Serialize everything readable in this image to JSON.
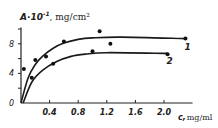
{
  "chart_data": {
    "type": "line",
    "title": "",
    "ylabel": "A·10⁻¹, mg/cm²",
    "ylabel_main": "A·10",
    "ylabel_exp": "-1",
    "ylabel_unit": ", mg/cm²",
    "xlabel": "c, mg/ml",
    "xlabel_main": "c,",
    "xlabel_unit": "mg/ml",
    "xlim": [
      0,
      2.4
    ],
    "ylim": [
      0,
      10
    ],
    "x_ticks": [
      "0.4",
      "0.8",
      "1.2",
      "1.6",
      "2.0"
    ],
    "x_tick_values": [
      0.4,
      0.8,
      1.2,
      1.6,
      2.0
    ],
    "y_ticks": [
      "0",
      "4",
      "8"
    ],
    "y_tick_values": [
      0,
      4,
      8
    ],
    "grid": false,
    "legend": "curve labels at right end",
    "series": [
      {
        "name": "1",
        "curve": [
          [
            0,
            0
          ],
          [
            0.1,
            3.4
          ],
          [
            0.2,
            5.2
          ],
          [
            0.3,
            6.3
          ],
          [
            0.45,
            7.4
          ],
          [
            0.6,
            8.1
          ],
          [
            0.8,
            8.6
          ],
          [
            1.0,
            8.8
          ],
          [
            1.4,
            8.9
          ],
          [
            2.3,
            8.7
          ]
        ],
        "points": [
          [
            0.04,
            4.6
          ],
          [
            0.2,
            5.8
          ],
          [
            0.35,
            6.3
          ],
          [
            0.6,
            8.3
          ],
          [
            1.1,
            9.7
          ],
          [
            2.3,
            8.7
          ]
        ]
      },
      {
        "name": "2",
        "curve": [
          [
            0.03,
            0
          ],
          [
            0.15,
            2.8
          ],
          [
            0.3,
            4.4
          ],
          [
            0.5,
            5.6
          ],
          [
            0.7,
            6.3
          ],
          [
            0.9,
            6.6
          ],
          [
            1.2,
            6.8
          ],
          [
            2.05,
            6.7
          ]
        ],
        "points": [
          [
            0.15,
            3.4
          ],
          [
            0.45,
            5.3
          ],
          [
            1.0,
            7.0
          ],
          [
            1.25,
            8.0
          ],
          [
            2.05,
            6.6
          ]
        ]
      }
    ]
  }
}
